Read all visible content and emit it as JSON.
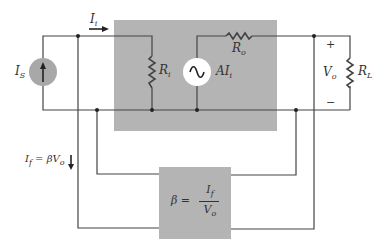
{
  "diagram": {
    "colors": {
      "block_fill": "#b4b4b4",
      "source_fill": "#a8a8a8",
      "wire": "#444444",
      "background": "#ffffff"
    },
    "labels": {
      "input_current": {
        "main": "I",
        "sub": "i"
      },
      "source_current": {
        "main": "I",
        "sub": "S"
      },
      "input_resistance": {
        "main": "R",
        "sub": "i"
      },
      "output_resistance": {
        "main": "R",
        "sub": "o"
      },
      "controlled_source": {
        "main": "AI",
        "sub": "i"
      },
      "output_voltage": {
        "main": "V",
        "sub": "o"
      },
      "load_resistance": {
        "main": "R",
        "sub": "L"
      },
      "plus_sign": "+",
      "minus_sign": "−",
      "feedback_current": {
        "lhs_main": "I",
        "lhs_sub": "f",
        "eq": " = βV",
        "rhs_sub": "o"
      },
      "feedback_block": {
        "lhs": "β =",
        "num_main": "I",
        "num_sub": "f",
        "den_main": "V",
        "den_sub": "o"
      }
    },
    "components": [
      {
        "id": "Is",
        "type": "current-source",
        "label": "I_S"
      },
      {
        "id": "Ri",
        "type": "resistor",
        "label": "R_i"
      },
      {
        "id": "AIi",
        "type": "ac-source",
        "label": "AI_i"
      },
      {
        "id": "Ro",
        "type": "resistor",
        "label": "R_o"
      },
      {
        "id": "RL",
        "type": "resistor",
        "label": "R_L"
      },
      {
        "id": "beta",
        "type": "feedback-block",
        "label": "β = I_f / V_o"
      }
    ]
  }
}
